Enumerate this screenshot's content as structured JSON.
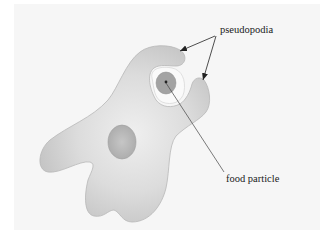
{
  "diagram": {
    "labels": {
      "pseudopodia": "pseudopodia",
      "food_particle": "food particle"
    },
    "colors": {
      "background": "#ffffff",
      "panel": "#f6f6f6",
      "cell_edge": "#bdbdbd",
      "cell_center": "#ececec",
      "nucleus": "#b4b4b4",
      "vacuole": "#fafafa",
      "food_particle": "#9a9a9a",
      "leader_line": "#333333"
    }
  }
}
